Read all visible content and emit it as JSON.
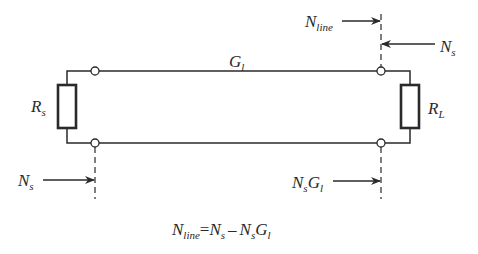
{
  "diagram": {
    "type": "transmission-line noise diagram",
    "line": {
      "label_main": "G",
      "label_sub": "l"
    },
    "source_resistor": {
      "label_main": "R",
      "label_sub": "s"
    },
    "load_resistor": {
      "label_main": "R",
      "label_sub": "L"
    },
    "arrows": {
      "input_noise": {
        "main": "N",
        "sub": "s"
      },
      "line_noise": {
        "main": "N",
        "sub": "line"
      },
      "output_source_noise": {
        "main": "N",
        "sub": "s"
      },
      "transmitted_noise": {
        "main1": "N",
        "sub1": "s",
        "main2": "G",
        "sub2": "l"
      }
    },
    "equation": {
      "lhs_main": "N",
      "lhs_sub": "line",
      "eq": "=",
      "t1_main": "N",
      "t1_sub": "s",
      "minus": "–",
      "t2_main1": "N",
      "t2_sub1": "s",
      "t2_main2": "G",
      "t2_sub2": "l"
    },
    "colors": {
      "ink": "#2a2a2a",
      "background": "#ffffff"
    }
  }
}
